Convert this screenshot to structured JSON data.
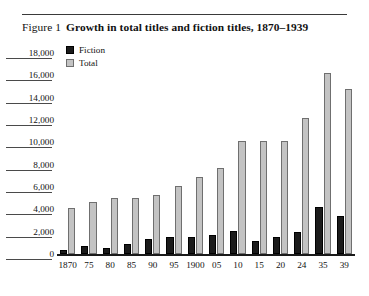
{
  "figure": {
    "label": "Figure 1",
    "title": "Growth in total titles and fiction titles, 1870–1939"
  },
  "legend": {
    "position": "top-left",
    "items": [
      {
        "name": "Fiction",
        "color": "#1b1b1b"
      },
      {
        "name": "Total",
        "color": "#c3c3c3"
      }
    ]
  },
  "chart_data": {
    "type": "bar",
    "title": "Growth in total titles and fiction titles, 1870–1939",
    "xlabel": "",
    "ylabel": "",
    "ylim": [
      0,
      18000
    ],
    "ytick_step": 2000,
    "yticks": [
      "0",
      "2,000",
      "4,000",
      "6,000",
      "8,000",
      "10,000",
      "12,000",
      "14,000",
      "16,000",
      "18,000"
    ],
    "ytick_values": [
      0,
      2000,
      4000,
      6000,
      8000,
      10000,
      12000,
      14000,
      16000,
      18000
    ],
    "grid": false,
    "categories": [
      "1870",
      "75",
      "80",
      "85",
      "90",
      "95",
      "1900",
      "05",
      "10",
      "15",
      "20",
      "24",
      "35",
      "39"
    ],
    "series": [
      {
        "name": "Fiction",
        "color": "#1b1b1b",
        "values": [
          400,
          700,
          500,
          900,
          1300,
          1500,
          1500,
          1700,
          2100,
          1200,
          1500,
          2000,
          4200,
          3400
        ]
      },
      {
        "name": "Total",
        "color": "#c3c3c3",
        "values": [
          4100,
          4700,
          5000,
          5000,
          5300,
          6100,
          6900,
          7700,
          10100,
          10100,
          10100,
          12200,
          16200,
          14800
        ]
      }
    ]
  }
}
